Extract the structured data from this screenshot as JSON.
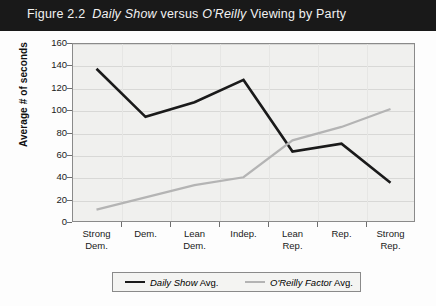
{
  "figure": {
    "label": "Figure 2.2",
    "title_italic_1": "Daily Show",
    "title_mid": "versus",
    "title_italic_2": "O'Reilly",
    "title_tail": "Viewing by Party",
    "full_title": "Figure 2.2  Daily Show versus O'Reilly Viewing by Party"
  },
  "colors": {
    "titlebar_bg": "#191919",
    "titlebar_text": "#f2f2f2",
    "plot_bg": "#f0f0ee",
    "plot_border": "#8a8a8a",
    "gridline": "#d8d8d6",
    "daily_show_line": "#1a1a1a",
    "oreilly_line": "#b4b4b4"
  },
  "legend": {
    "position": "bottom-center",
    "items": [
      {
        "label_italic": "Daily Show",
        "label_tail": "Avg.",
        "color": "#1a1a1a"
      },
      {
        "label_italic": "O'Reilly Factor",
        "label_tail": "Avg.",
        "color": "#b4b4b4"
      }
    ]
  },
  "chart_data": {
    "type": "line",
    "xlabel": "",
    "ylabel": "Average # of seconds",
    "ylim": [
      0,
      160
    ],
    "yticks": [
      0,
      20,
      40,
      60,
      80,
      100,
      120,
      140,
      160
    ],
    "grid": true,
    "categories": [
      "Strong Dem.",
      "Dem.",
      "Lean Dem.",
      "Indep.",
      "Lean Rep.",
      "Rep.",
      "Strong Rep."
    ],
    "category_lines": [
      [
        "Strong",
        "Dem."
      ],
      [
        "Dem.",
        ""
      ],
      [
        "Lean",
        "Dem."
      ],
      [
        "Indep.",
        ""
      ],
      [
        "Lean",
        "Rep."
      ],
      [
        "Rep.",
        ""
      ],
      [
        "Strong",
        "Rep."
      ]
    ],
    "series": [
      {
        "name": "Daily Show Avg.",
        "color": "#1a1a1a",
        "values": [
          137,
          94,
          107,
          127,
          63,
          70,
          35
        ]
      },
      {
        "name": "O'Reilly Factor Avg.",
        "color": "#b4b4b4",
        "values": [
          11,
          22,
          33,
          40,
          73,
          85,
          101
        ]
      }
    ]
  }
}
